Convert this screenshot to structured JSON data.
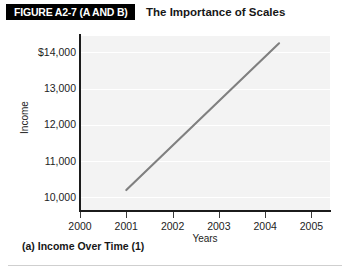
{
  "header": {
    "badge_label": "FIGURE A2-7 (A AND B)",
    "title": "The Importance of Scales"
  },
  "caption": "(a) Income Over Time (1)",
  "colors": {
    "badge_background": "#000000",
    "badge_text": "#ffffff",
    "plot_background": "#f3f3f3",
    "gridline": "#ffffff",
    "axis": "#1b1b1b",
    "series_line": "#808080",
    "divider": "#cfcfcf"
  },
  "chart_data": {
    "type": "line",
    "title": "The Importance of Scales",
    "subtitle": "(a) Income Over Time (1)",
    "xlabel": "Years",
    "ylabel": "Income",
    "x_tick_labels": [
      "2000",
      "2001",
      "2002",
      "2003",
      "2004",
      "2005"
    ],
    "x_ticks": [
      2000,
      2001,
      2002,
      2003,
      2004,
      2005
    ],
    "y_tick_labels": [
      "$14,000",
      "13,000",
      "12,000",
      "11,000",
      "10,000"
    ],
    "y_ticks": [
      14000,
      13000,
      12000,
      11000,
      10000
    ],
    "xlim": [
      2000,
      2005.4
    ],
    "ylim": [
      9650,
      14450
    ],
    "grid": true,
    "grid_axis": "y",
    "legend": false,
    "series": [
      {
        "name": "Income",
        "x": [
          2001.0,
          2004.3
        ],
        "values": [
          10200,
          14250
        ]
      }
    ]
  }
}
